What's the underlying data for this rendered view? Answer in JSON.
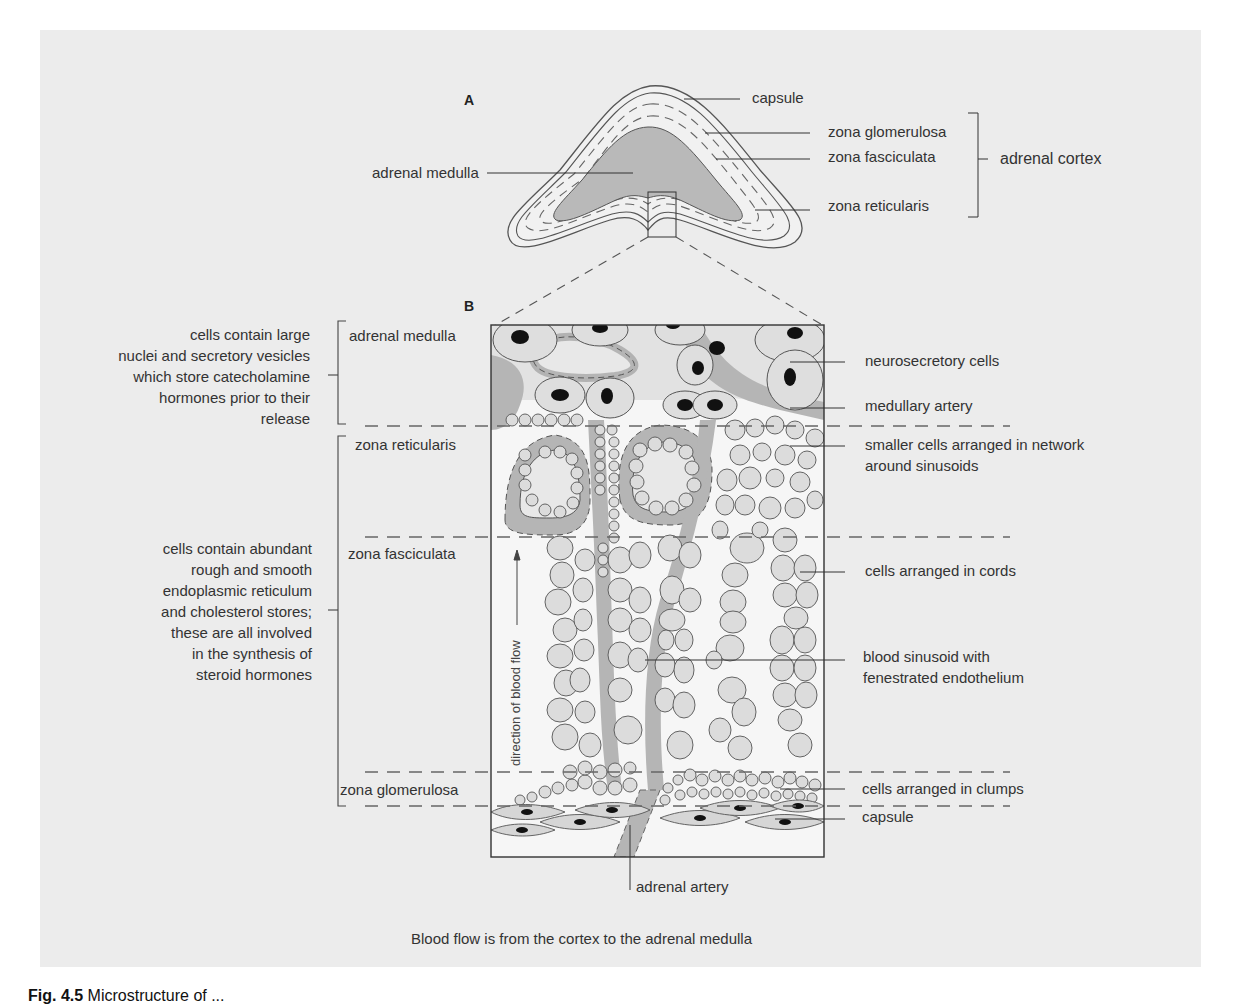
{
  "panel_a": {
    "letter": "A",
    "labels": {
      "capsule": "capsule",
      "zona_glomerulosa": "zona glomerulosa",
      "zona_fasciculata": "zona fasciculata",
      "zona_reticularis": "zona reticularis",
      "adrenal_cortex": "adrenal cortex",
      "adrenal_medulla": "adrenal medulla"
    }
  },
  "panel_b": {
    "letter": "B",
    "zones": {
      "adrenal_medulla": "adrenal medulla",
      "zona_reticularis": "zona reticularis",
      "zona_fasciculata": "zona fasciculata",
      "zona_glomerulosa": "zona glomerulosa"
    },
    "left_notes": {
      "medulla": [
        "cells contain large",
        "nuclei and secretory vesicles",
        "which store catecholamine",
        "hormones prior to their",
        "release"
      ],
      "cortex": [
        "cells contain abundant",
        "rough and smooth",
        "endoplasmic reticulum",
        "and cholesterol stores;",
        "these are all involved",
        "in the synthesis of",
        "steroid hormones"
      ]
    },
    "right_labels": {
      "neurosecretory_cells": "neurosecretory cells",
      "medullary_artery": "medullary artery",
      "smaller_cells": [
        "smaller cells arranged in network",
        "around sinusoids"
      ],
      "cells_in_cords": "cells arranged in cords",
      "blood_sinusoid": [
        "blood sinusoid with",
        "fenestrated endothelium"
      ],
      "cells_in_clumps": "cells arranged in clumps",
      "capsule": "capsule"
    },
    "bottom_label": "adrenal artery",
    "flow_label": "direction of blood flow"
  },
  "caption": "Blood flow is from the cortex to the adrenal medulla",
  "figure_caption": {
    "prefix": "Fig. 4.5",
    "text": "Microstructure of ..."
  },
  "colors": {
    "panel_bg": "#ececec",
    "tissue_gray": "#b5b5b5",
    "cell_fill": "#dcdcdc",
    "line": "#444444",
    "nucleus": "#111111"
  }
}
